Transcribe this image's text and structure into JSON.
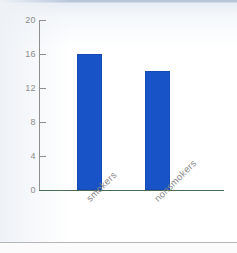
{
  "chart_data": {
    "type": "bar",
    "title": "",
    "xlabel": "",
    "ylabel": "",
    "categories": [
      "smokers",
      "nonsmokers"
    ],
    "values": [
      16,
      14
    ],
    "ylim": [
      0,
      20
    ],
    "yticks": [
      0,
      4,
      8,
      12,
      16,
      20
    ],
    "ytick_labels": [
      "0",
      "4",
      "8",
      "12",
      "16",
      "20"
    ],
    "grid": false,
    "legend": false,
    "bar_color": "#1853c7",
    "axis_color": "#8e8e8e",
    "baseline_color": "#4b6b55",
    "tick_label_color": "#8d8d8d"
  },
  "axis": {
    "y": {
      "t0": "0",
      "t1": "4",
      "t2": "8",
      "t3": "12",
      "t4": "16",
      "t5": "20"
    },
    "x": {
      "c0": "smokers",
      "c1": "nonsmokers"
    }
  }
}
